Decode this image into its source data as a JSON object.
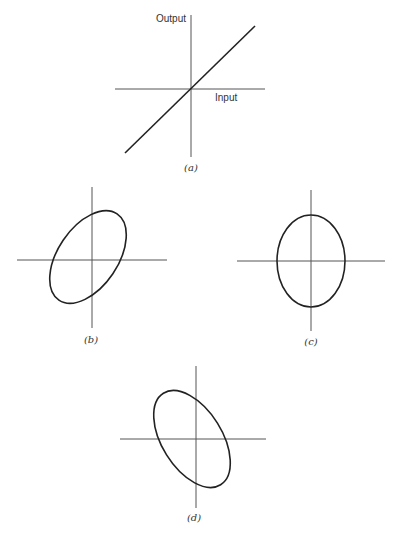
{
  "figure": {
    "panels": [
      {
        "id": "a",
        "caption": "(a)",
        "type": "line",
        "x_axis_label": "Input",
        "y_axis_label": "Output",
        "description": "Linear input-output relation through origin"
      },
      {
        "id": "b",
        "caption": "(b)",
        "type": "ellipse",
        "tilt": "positive slope"
      },
      {
        "id": "c",
        "caption": "(c)",
        "type": "ellipse",
        "tilt": "upright (axes aligned)"
      },
      {
        "id": "d",
        "caption": "(d)",
        "type": "ellipse",
        "tilt": "negative slope"
      }
    ],
    "colors": {
      "axis": "#555555",
      "curve": "#222222",
      "background": "#ffffff"
    }
  }
}
